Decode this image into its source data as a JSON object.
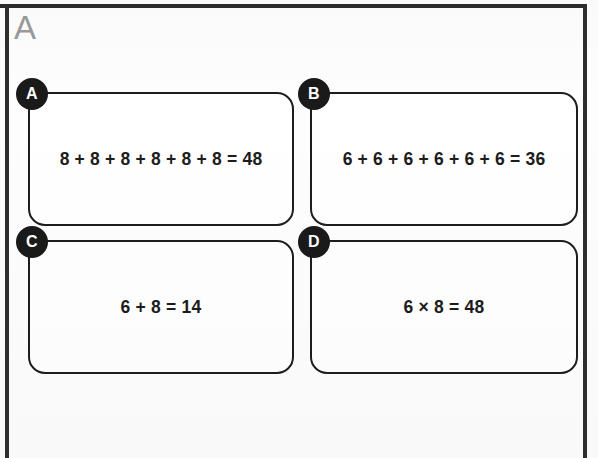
{
  "page": {
    "label": "A",
    "background_color": "#fdfdfd",
    "border_color": "#2b2b2b",
    "label_color": "#9a9a9a"
  },
  "answer_options": {
    "badge_color": "#1a1a1a",
    "badge_text_color": "#ffffff",
    "card_border_color": "#1d1d1d",
    "items": [
      {
        "badge": "A",
        "text": "8 + 8 + 8 + 8 + 8 + 8 = 48"
      },
      {
        "badge": "B",
        "text": "6 + 6 + 6 + 6 + 6 + 6 = 36"
      },
      {
        "badge": "C",
        "text": "6 + 8 = 14"
      },
      {
        "badge": "D",
        "text": "6 × 8 = 48"
      }
    ]
  }
}
